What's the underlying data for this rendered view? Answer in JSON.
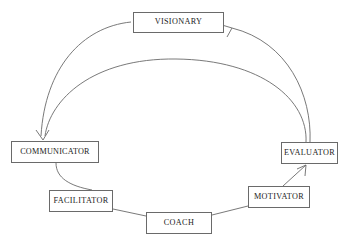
{
  "diagram": {
    "type": "cycle-diagram",
    "background_color": "#ffffff",
    "line_color": "#6a6a6a",
    "text_color": "#1c1c1c",
    "nodes": [
      {
        "id": "visionary",
        "label": "VISIONARY",
        "x": 133,
        "y": 12,
        "w": 91,
        "h": 21
      },
      {
        "id": "communicator",
        "label": "COMMUNICATOR",
        "x": 11,
        "y": 141,
        "w": 88,
        "h": 22
      },
      {
        "id": "evaluator",
        "label": "EVALUATOR",
        "x": 281,
        "y": 142,
        "w": 57,
        "h": 22
      },
      {
        "id": "facilitator",
        "label": "FACILITATOR",
        "x": 49,
        "y": 190,
        "w": 64,
        "h": 22
      },
      {
        "id": "motivator",
        "label": "MOTIVATOR",
        "x": 248,
        "y": 186,
        "w": 62,
        "h": 22
      },
      {
        "id": "coach",
        "label": "COACH",
        "x": 146,
        "y": 212,
        "w": 66,
        "h": 22
      }
    ],
    "edges": [
      {
        "id": "visionary-to-communicator",
        "from": "visionary",
        "to": "communicator",
        "style": "curved-arc",
        "arrow": true
      },
      {
        "id": "evaluator-to-communicator",
        "from": "evaluator",
        "to": "communicator",
        "style": "curved-arc",
        "arrow": true
      },
      {
        "id": "evaluator-to-visionary",
        "from": "evaluator",
        "to": "visionary",
        "style": "curved-arc",
        "arrow": true
      },
      {
        "id": "communicator-to-facilitator",
        "from": "communicator",
        "to": "facilitator",
        "style": "curved",
        "arrow": false
      },
      {
        "id": "facilitator-to-coach",
        "from": "facilitator",
        "to": "coach",
        "style": "straight",
        "arrow": false
      },
      {
        "id": "coach-to-motivator",
        "from": "coach",
        "to": "motivator",
        "style": "straight",
        "arrow": false
      },
      {
        "id": "motivator-to-evaluator",
        "from": "motivator",
        "to": "evaluator",
        "style": "straight",
        "arrow": true
      }
    ]
  }
}
